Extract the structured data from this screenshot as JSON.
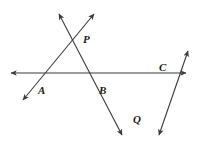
{
  "figure": {
    "background_color": "#ffffff",
    "stroke_color": "#3a3a3a",
    "label_color": "#1a1a1a",
    "stroke_width": 1.1
  },
  "points": [
    {
      "id": "A",
      "label": "A",
      "x": 38,
      "y": 85,
      "description": "label below-left of horizontal line near left transversal crossing"
    },
    {
      "id": "B",
      "label": "B",
      "x": 99,
      "y": 85,
      "description": "label below horizontal line at middle crossing"
    },
    {
      "id": "C",
      "label": "C",
      "x": 159,
      "y": 62,
      "description": "label above horizontal line at right crossing"
    },
    {
      "id": "P",
      "label": "P",
      "x": 83,
      "y": 34,
      "description": "label right of upper X intersection"
    },
    {
      "id": "Q",
      "label": "Q",
      "x": 133,
      "y": 114,
      "description": "label right of lower X intersection"
    }
  ],
  "lines": [
    {
      "id": "horizontal",
      "name": "horizontal-line",
      "x1": 11,
      "y1": 73,
      "x2": 186,
      "y2": 73,
      "arrow_start": true,
      "arrow_end": true
    },
    {
      "id": "line-A-P",
      "name": "transversal-through-a-and-p",
      "x1": 23,
      "y1": 100,
      "x2": 94,
      "y2": 14,
      "arrow_start": true,
      "arrow_end": true
    },
    {
      "id": "line-P-B-Q",
      "name": "transversal-through-p-b-and-q",
      "x1": 59,
      "y1": 14,
      "x2": 122,
      "y2": 135,
      "arrow_start": true,
      "arrow_end": true
    },
    {
      "id": "line-Q-C",
      "name": "transversal-through-q-and-c",
      "x1": 159,
      "y1": 135,
      "x2": 188,
      "y2": 51,
      "arrow_start": true,
      "arrow_end": true
    }
  ],
  "intersections": [
    {
      "id": "P",
      "x": 79,
      "y": 37,
      "lines": [
        "line-A-P",
        "line-P-B-Q"
      ]
    },
    {
      "id": "A",
      "x": 41,
      "y": 73,
      "lines": [
        "horizontal",
        "line-A-P"
      ]
    },
    {
      "id": "B",
      "x": 101,
      "y": 73,
      "lines": [
        "horizontal",
        "line-P-B-Q"
      ]
    },
    {
      "id": "C",
      "x": 166,
      "y": 73,
      "lines": [
        "horizontal",
        "line-Q-C"
      ]
    },
    {
      "id": "Q",
      "x": 140,
      "y": 107,
      "lines": [
        "line-P-B-Q",
        "line-Q-C"
      ]
    }
  ]
}
